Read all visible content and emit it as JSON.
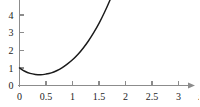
{
  "chart_data": {
    "type": "line",
    "title": "",
    "subtitle": "",
    "xlabel": "x",
    "ylabel": "",
    "xlim": [
      0,
      3
    ],
    "ylim": [
      0,
      4.6
    ],
    "grid": false,
    "legend": null,
    "axis_color": "#8c8c8c",
    "curve_color": "#1a1a1a",
    "x_ticks": [
      {
        "value": 0,
        "label": "0"
      },
      {
        "value": 0.5,
        "label": "0.5"
      },
      {
        "value": 1,
        "label": "1"
      },
      {
        "value": 1.5,
        "label": "1.5"
      },
      {
        "value": 2,
        "label": "2"
      },
      {
        "value": 2.5,
        "label": "2.5"
      },
      {
        "value": 3,
        "label": "3"
      }
    ],
    "y_ticks": [
      {
        "value": 0,
        "label": "0"
      },
      {
        "value": 1,
        "label": "1"
      },
      {
        "value": 2,
        "label": "2"
      },
      {
        "value": 3,
        "label": "3"
      },
      {
        "value": 4,
        "label": "4"
      }
    ],
    "series": [
      {
        "name": "curve",
        "x": [
          0.0,
          0.1,
          0.2,
          0.3,
          0.4,
          0.5,
          0.6,
          0.7,
          0.8,
          0.9,
          1.0,
          1.1,
          1.2,
          1.3,
          1.4,
          1.5,
          1.6,
          1.7,
          1.8,
          1.9,
          2.0,
          2.05,
          2.1
        ],
        "y": [
          1.0,
          0.81,
          0.69,
          0.63,
          0.61,
          0.65,
          0.72,
          0.84,
          1.0,
          1.21,
          1.46,
          1.76,
          2.12,
          2.53,
          3.0,
          3.53,
          4.13,
          4.8,
          5.55,
          6.39,
          7.31,
          7.81,
          8.33
        ]
      }
    ],
    "x_axis_arrow": true,
    "y_axis_arrow": false,
    "axis_label_end": "x"
  }
}
